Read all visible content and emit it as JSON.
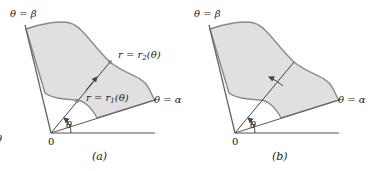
{
  "figure": {
    "panels": [
      {
        "id": "a",
        "caption": "(a)",
        "labels": {
          "beta_ray": "θ = β",
          "alpha_ray": "θ = α",
          "outer_curve": "r = r",
          "outer_sub": "2",
          "outer_arg": "(θ)",
          "inner_curve": "r = r",
          "inner_sub": "1",
          "inner_arg": "(θ)",
          "angle": "θ",
          "origin": "0"
        }
      },
      {
        "id": "b",
        "caption": "(b)",
        "labels": {
          "beta_ray": "θ = β",
          "alpha_ray": "θ = α",
          "angle": "θ",
          "origin": "0"
        }
      }
    ],
    "left_edge_fragment": "θ"
  },
  "colors": {
    "region_fill": "#e0e0e0",
    "region_stroke": "#8a8a8a",
    "line": "#444444"
  }
}
